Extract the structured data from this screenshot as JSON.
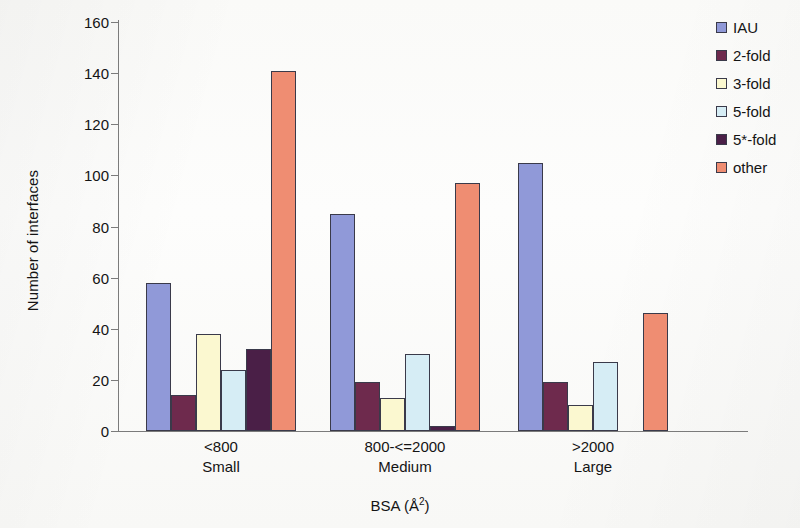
{
  "chart_data": {
    "type": "bar",
    "title": "",
    "xlabel": "BSA  (Å2)",
    "xlabel_base": "BSA  (Å",
    "xlabel_sup": "2",
    "xlabel_close": ")",
    "ylabel": "Number of interfaces",
    "ylim": [
      0,
      160
    ],
    "ytick_step": 20,
    "yticks": [
      0,
      20,
      40,
      60,
      80,
      100,
      120,
      140,
      160
    ],
    "grid": false,
    "legend_position": "top-right",
    "categories": [
      "<800",
      "800-<=2000",
      ">2000"
    ],
    "category_sublabels": [
      "Small",
      "Medium",
      "Large"
    ],
    "series": [
      {
        "name": "IAU",
        "color": "#9099d8",
        "values": [
          58,
          85,
          105
        ]
      },
      {
        "name": "2-fold",
        "color": "#6e2a4d",
        "values": [
          14,
          19,
          19
        ]
      },
      {
        "name": "3-fold",
        "color": "#fbf8d0",
        "values": [
          38,
          13,
          10
        ]
      },
      {
        "name": "5-fold",
        "color": "#d6edf5",
        "values": [
          24,
          30,
          27
        ]
      },
      {
        "name": "5*-fold",
        "color": "#4a1f47",
        "values": [
          32,
          2,
          0
        ]
      },
      {
        "name": "other",
        "color": "#ef8d72",
        "values": [
          141,
          97,
          46
        ]
      }
    ]
  },
  "legend": {
    "items": [
      {
        "label": "IAU",
        "color": "#9099d8"
      },
      {
        "label": "2-fold",
        "color": "#6e2a4d"
      },
      {
        "label": "3-fold",
        "color": "#fbf8d0"
      },
      {
        "label": "5-fold",
        "color": "#d6edf5"
      },
      {
        "label": "5*-fold",
        "color": "#4a1f47"
      },
      {
        "label": "other",
        "color": "#ef8d72"
      }
    ]
  }
}
